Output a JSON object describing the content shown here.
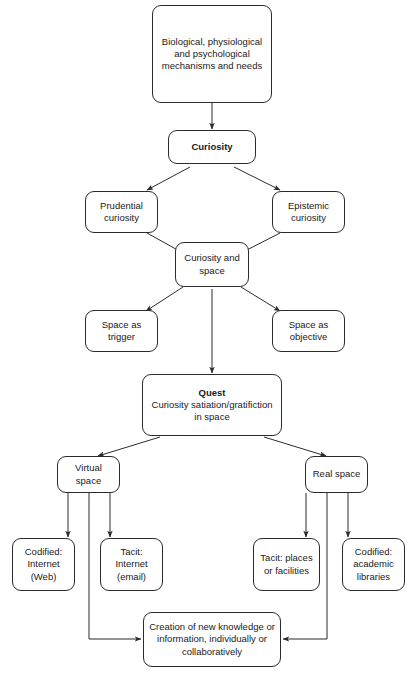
{
  "diagram": {
    "accent_color": "#2b2b2b",
    "background_color": "#ffffff",
    "nodes": {
      "mechanisms": {
        "label": "Biological, physiological and psychological mechanisms and needs"
      },
      "curiosity": {
        "label": "Curiosity"
      },
      "prudential": {
        "label": "Prudential curiosity"
      },
      "epistemic": {
        "label": "Epistemic curiosity"
      },
      "curiosity_space": {
        "label": "Curiosity and space"
      },
      "space_trigger": {
        "label": "Space as trigger"
      },
      "space_objective": {
        "label": "Space as objective"
      },
      "quest": {
        "heading": "Quest",
        "label": "Curiosity satiation/gratifiction in space"
      },
      "virtual_space": {
        "label": "Virtual space"
      },
      "real_space": {
        "label": "Real space"
      },
      "codified_internet": {
        "label": "Codified: Internet (Web)"
      },
      "tacit_internet": {
        "label": "Tacit: Internet (email)"
      },
      "tacit_places": {
        "label": "Tacit: places or facilities"
      },
      "codified_libraries": {
        "label": "Codified: academic libraries"
      },
      "creation": {
        "label": "Creation of new knowledge or information, individually or collaboratively"
      }
    }
  }
}
